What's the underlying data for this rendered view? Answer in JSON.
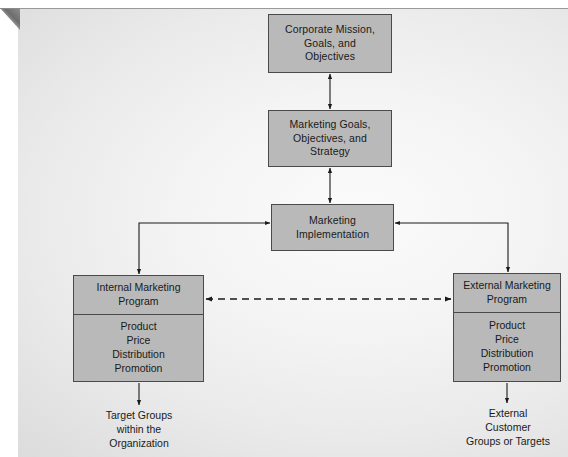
{
  "figure": {
    "background_color": "#ededed",
    "box_fill": "#b9b9b9",
    "box_border": "#4a4a4a",
    "text_color": "#1a1a1a"
  },
  "nodes": {
    "corporate": {
      "lines": [
        "Corporate Mission,",
        "Goals, and",
        "Objectives"
      ]
    },
    "marketing_goals": {
      "lines": [
        "Marketing Goals,",
        "Objectives, and",
        "Strategy"
      ]
    },
    "marketing_implementation": {
      "lines": [
        "Marketing",
        "Implementation"
      ]
    },
    "internal_program": {
      "header": [
        "Internal Marketing",
        "Program"
      ],
      "mix": [
        "Product",
        "Price",
        "Distribution",
        "Promotion"
      ]
    },
    "external_program": {
      "header": [
        "External Marketing",
        "Program"
      ],
      "mix": [
        "Product",
        "Price",
        "Distribution",
        "Promotion"
      ]
    }
  },
  "captions": {
    "target_groups": [
      "Target Groups",
      "within the",
      "Organization"
    ],
    "external_customers": [
      "External",
      "Customer",
      "Groups or Targets"
    ]
  },
  "connectors": [
    {
      "name": "corporate-to-marketing-goals",
      "style": "solid",
      "heads": "both",
      "orientation": "vertical"
    },
    {
      "name": "marketing-goals-to-implementation",
      "style": "solid",
      "heads": "both",
      "orientation": "vertical"
    },
    {
      "name": "internal-to-implementation",
      "style": "solid",
      "heads": "both",
      "orientation": "elbow-left"
    },
    {
      "name": "implementation-to-external",
      "style": "solid",
      "heads": "both",
      "orientation": "elbow-right"
    },
    {
      "name": "internal-external-link",
      "style": "dashed",
      "heads": "both",
      "orientation": "horizontal"
    },
    {
      "name": "internal-to-target-groups",
      "style": "solid",
      "heads": "end",
      "orientation": "vertical"
    },
    {
      "name": "external-to-customers",
      "style": "solid",
      "heads": "end",
      "orientation": "vertical"
    }
  ]
}
